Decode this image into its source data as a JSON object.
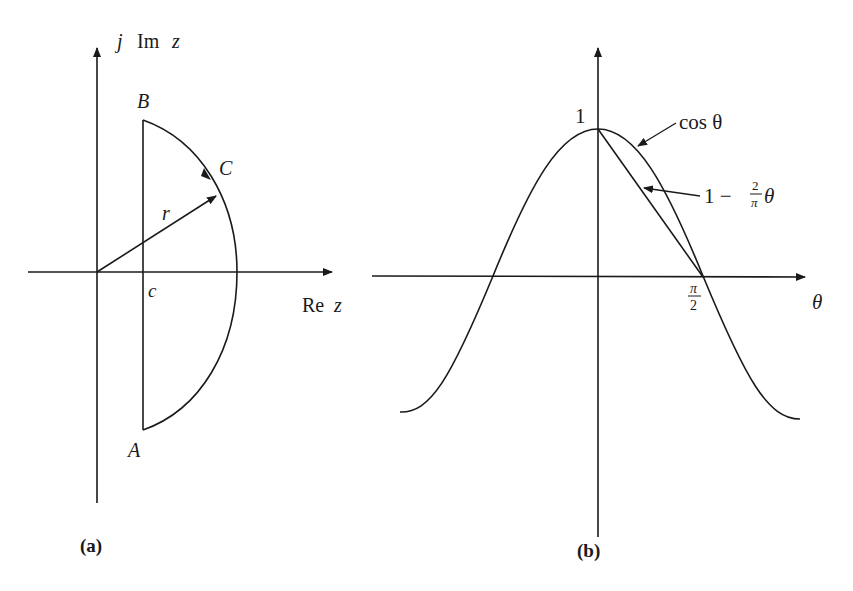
{
  "panel_a": {
    "caption": "(a)",
    "axes": {
      "y_label_j": "j",
      "y_label_im": "Im",
      "y_label_z": "z",
      "x_label_re": "Re",
      "x_label_z": "z"
    },
    "points": {
      "A": "A",
      "B": "B",
      "C": "C",
      "c": "c",
      "r": "r"
    }
  },
  "panel_b": {
    "caption": "(b)",
    "axes": {
      "x_label": "θ",
      "y_tick_1": "1",
      "x_tick_num": "π",
      "x_tick_den": "2"
    },
    "curves": {
      "cos_label": "cos θ",
      "line_label_prefix": "1 −",
      "line_label_num": "2",
      "line_label_den": "π",
      "line_label_suffix": "θ"
    }
  },
  "colors": {
    "ink": "#1a1a1a",
    "background": "#ffffff"
  }
}
